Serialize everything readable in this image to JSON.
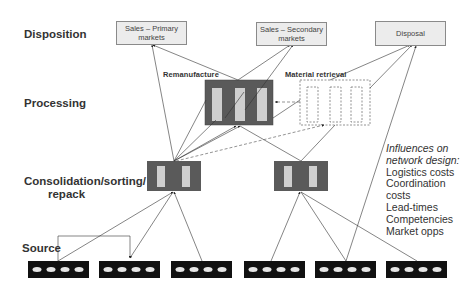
{
  "stages": {
    "disposition": "Disposition",
    "processing": "Processing",
    "consolidation_line1": "Consolidation/sorting/",
    "consolidation_line2": "repack",
    "source": "Source"
  },
  "disposition_boxes": {
    "primary_line1": "Sales – Primary",
    "primary_line2": "markets",
    "secondary_line1": "Sales – Secondary",
    "secondary_line2": "markets",
    "disposal": "Disposal"
  },
  "processing_labels": {
    "remanufacture": "Remanufacture",
    "material_retrieval": "Material retrieval"
  },
  "influences": {
    "title_line1": "Influences on",
    "title_line2": "network design:",
    "items": [
      "Logistics costs",
      "Coordination",
      "costs",
      "Lead-times",
      "Competencies",
      "Market opps"
    ]
  },
  "colors": {
    "node_fill": "#5a5a5a",
    "slot_fill": "#cfcfcf",
    "source_fill": "#111111",
    "source_dot": "#e6e6e6",
    "line": "#333333",
    "dashed": "#666666",
    "disposition_fill": "#ececec"
  }
}
